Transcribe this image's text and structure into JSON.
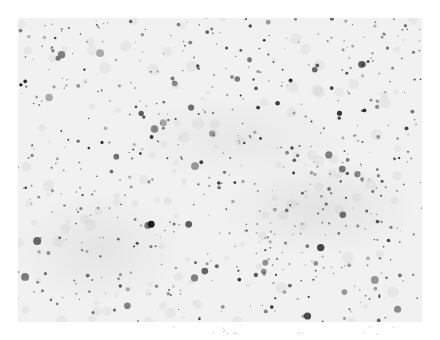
{
  "image": {
    "description": "Grayscale microscopy field showing many dark stained puncta scattered over a light gray background",
    "background_color": "#f1f1f1",
    "dot_color": "#2a2a2a",
    "frame": {
      "x": 18,
      "y": 18,
      "width": 404,
      "height": 304
    },
    "dot_count_estimate": 600,
    "seed": 7
  }
}
